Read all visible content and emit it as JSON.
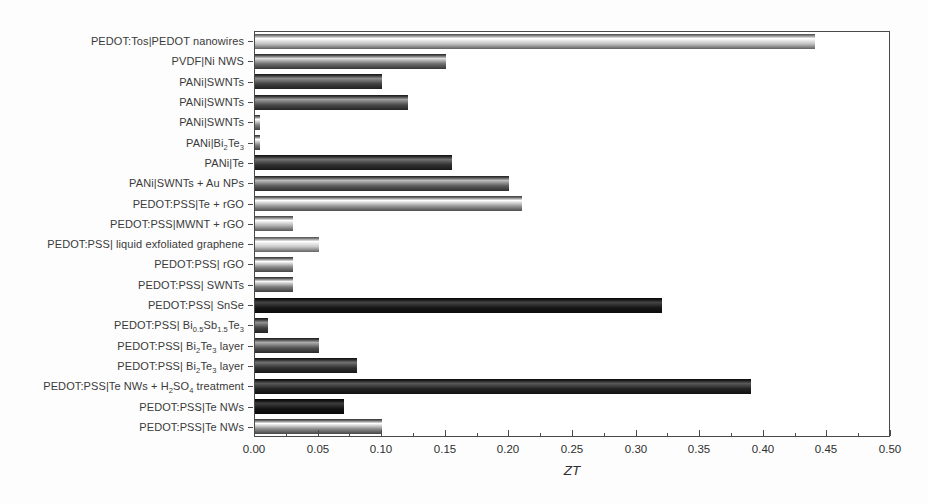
{
  "chart_data": {
    "type": "bar",
    "orientation": "horizontal",
    "title": "",
    "xlabel": "ZT",
    "ylabel": "",
    "xlim": [
      0,
      0.5
    ],
    "x_major_tick_step": 0.05,
    "x_minor_ticks": true,
    "grid": false,
    "legend": "none",
    "categories": [
      "PEDOT:Tos|PEDOT nanowires",
      "PVDF|Ni NWS",
      "PANi|SWNTs",
      "PANi|SWNTs",
      "PANi|SWNTs",
      "PANi|Bi~2~Te~3~",
      "PANi|Te",
      "PANi|SWNTs + Au NPs",
      "PEDOT:PSS|Te + rGO",
      "PEDOT:PSS|MWNT + rGO",
      "PEDOT:PSS| liquid exfoliated graphene",
      "PEDOT:PSS| rGO",
      "PEDOT:PSS| SWNTs",
      "PEDOT:PSS| SnSe",
      "PEDOT:PSS| Bi~0.5~Sb~1.5~Te~3~",
      "PEDOT:PSS| Bi~2~Te~3~ layer",
      "PEDOT:PSS| Bi~2~Te~3~ layer",
      "PEDOT:PSS|Te NWs + H~2~SO~4~ treatment",
      "PEDOT:PSS|Te NWs",
      "PEDOT:PSS|Te NWs"
    ],
    "values": [
      0.44,
      0.15,
      0.1,
      0.12,
      0.004,
      0.004,
      0.155,
      0.2,
      0.21,
      0.03,
      0.05,
      0.03,
      0.03,
      0.32,
      0.01,
      0.05,
      0.08,
      0.39,
      0.07,
      0.1
    ],
    "bar_colors": [
      "#c2c2c2",
      "#6e6e6e",
      "#404040",
      "#4a4a4a",
      "#828282",
      "#828282",
      "#303030",
      "#5c5c5c",
      "#9c9c9c",
      "#acacac",
      "#c6c6c6",
      "#8c8c8c",
      "#7c7c7c",
      "#161616",
      "#424242",
      "#525252",
      "#303030",
      "#222222",
      "#121212",
      "#8c8c8c"
    ],
    "x_tick_labels": [
      "0.00",
      "0.05",
      "0.10",
      "0.15",
      "0.20",
      "0.25",
      "0.30",
      "0.35",
      "0.40",
      "0.45",
      "0.50"
    ],
    "axis_color": "#4a4a4a",
    "label_color": "#3a3a3a"
  }
}
